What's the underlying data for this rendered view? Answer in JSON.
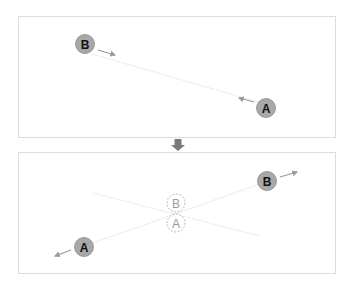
{
  "top_panel": {
    "node_b": {
      "label": "B",
      "x": 85,
      "y": 44
    },
    "node_a": {
      "label": "A",
      "x": 266,
      "y": 108
    }
  },
  "transition_arrow": {
    "direction": "down"
  },
  "bottom_panel": {
    "node_b": {
      "label": "B",
      "x": 267,
      "y": 181
    },
    "node_a": {
      "label": "A",
      "x": 84,
      "y": 247
    },
    "ghost_b": {
      "label": "B",
      "x": 176,
      "y": 203
    },
    "ghost_a": {
      "label": "A",
      "x": 176,
      "y": 223
    }
  },
  "colors": {
    "node_fill": "#a8a8a8",
    "node_stroke": "#8c8c8c",
    "label": "#111111",
    "line": "#e3e3e3",
    "arrow": "#9a9a9a",
    "ghost": "#9a9a9a",
    "panel_border": "#dcdcdc",
    "transition_arrow": "#7a7a7a"
  }
}
